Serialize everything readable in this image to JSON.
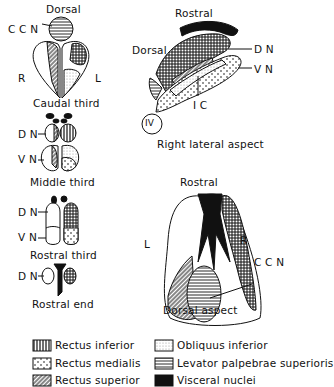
{
  "left_column": {
    "caudal": {
      "top": "Dorsal",
      "ccn": "C C N",
      "r": "R",
      "l": "L",
      "caption": "Caudal third"
    },
    "middle": {
      "dn": "D N",
      "vn": "V N",
      "caption": "Middle third"
    },
    "rostral": {
      "dn": "D N",
      "vn": "V N",
      "caption": "Rostral third"
    },
    "rostral_end": {
      "dn": "D N",
      "caption": "Rostral end"
    }
  },
  "lateral": {
    "top": "Rostral",
    "dorsal": "Dorsal",
    "dn": "D N",
    "vn": "V N",
    "ic": "I C",
    "iv": "IV",
    "caption": "Right lateral aspect"
  },
  "dorsal_view": {
    "top": "Rostral",
    "l": "L",
    "r": "R",
    "ccn": "C C N",
    "caption": "Dorsal aspect"
  },
  "legend": [
    {
      "label": "Rectus inferior",
      "pattern": "vertical-lines"
    },
    {
      "label": "Rectus medialis",
      "pattern": "dots"
    },
    {
      "label": "Rectus superior",
      "pattern": "diagonal-lines"
    },
    {
      "label": "Obliquus inferior",
      "pattern": "fine-stipple"
    },
    {
      "label": "Levator palpebrae superioris",
      "pattern": "horizontal-lines"
    },
    {
      "label": "Visceral nuclei",
      "pattern": "solid-black"
    }
  ]
}
